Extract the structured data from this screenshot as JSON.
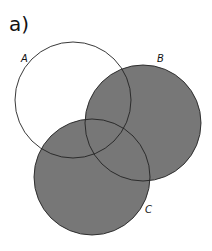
{
  "figure": {
    "panel_label": "a)",
    "fill_color": "#777777",
    "stroke_color": "#222222",
    "background": "#ffffff",
    "sets": [
      {
        "label": "A",
        "cx": 73,
        "cy": 100,
        "r": 58,
        "shaded": false,
        "label_x": 21,
        "label_y": 62
      },
      {
        "label": "B",
        "cx": 143,
        "cy": 123,
        "r": 58,
        "shaded": true,
        "label_x": 157,
        "label_y": 62
      },
      {
        "label": "C",
        "cx": 92,
        "cy": 177,
        "r": 58,
        "shaded": true,
        "label_x": 145,
        "label_y": 213
      }
    ],
    "shaded_expression": "B ∪ C"
  }
}
